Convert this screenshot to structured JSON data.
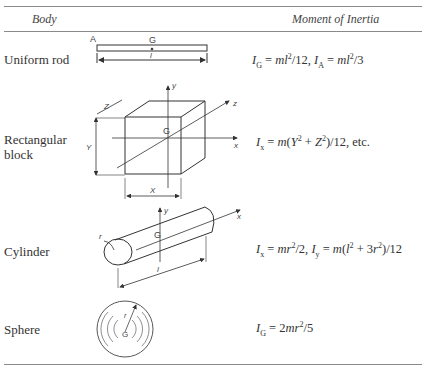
{
  "table": {
    "headers": {
      "body": "Body",
      "moment": "Moment of Inertia"
    },
    "rows": [
      {
        "body": "Uniform rod",
        "formula": "I_G = ml²/12, I_A = ml²/3",
        "diagram_labels": {
          "end": "A",
          "center": "G",
          "length": "l"
        }
      },
      {
        "body_line1": "Rectangular",
        "body_line2": "block",
        "formula": "I_x = m(Y² + Z²)/12, etc.",
        "diagram_labels": {
          "center": "G",
          "x_axis": "x",
          "y_axis": "y",
          "z_axis": "z",
          "dim_x": "X",
          "dim_y": "Y",
          "dim_z": "Z"
        }
      },
      {
        "body": "Cylinder",
        "formula": "I_x = mr²/2, I_y = m(l² + 3r²)/12",
        "diagram_labels": {
          "center": "G",
          "x_axis": "x",
          "y_axis": "y",
          "radius": "r",
          "length": "l"
        }
      },
      {
        "body": "Sphere",
        "formula": "I_G = 2mr²/5",
        "diagram_labels": {
          "center": "G",
          "radius": "r"
        }
      }
    ]
  }
}
